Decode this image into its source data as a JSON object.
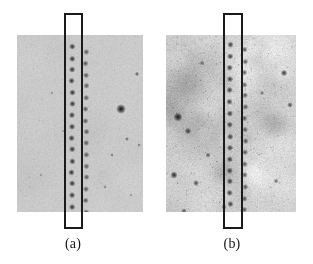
{
  "figure": {
    "background_color": "#ffffff",
    "width": 313,
    "height": 264,
    "kind": "two-panel grayscale radiograph comparison"
  },
  "panels": [
    {
      "id": "a",
      "caption": "(a)",
      "rect": {
        "x": 17,
        "y": 35,
        "w": 126,
        "h": 177
      },
      "base_gray": "#c9c9c9",
      "noise_amplitude": 11,
      "mottle_amplitude": 5,
      "mottle_count": 26,
      "description": "uniform light-gray radiograph with low background mottle",
      "dot_columns": [
        {
          "x": 55,
          "y_start": 12,
          "spacing": 11.4,
          "count": 16,
          "radius": 1.7,
          "darkness": 78,
          "jitter": 0.5
        },
        {
          "x": 69,
          "y_start": 17,
          "spacing": 11.4,
          "count": 15,
          "radius": 1.6,
          "darkness": 60,
          "jitter": 0.6
        }
      ],
      "specks": [
        {
          "x": 104,
          "y": 74,
          "r": 2.6,
          "d": 96
        },
        {
          "x": 120,
          "y": 39,
          "r": 1.2,
          "d": 58
        },
        {
          "x": 110,
          "y": 104,
          "r": 1.1,
          "d": 52
        },
        {
          "x": 95,
          "y": 120,
          "r": 1.0,
          "d": 46
        },
        {
          "x": 122,
          "y": 110,
          "r": 1.0,
          "d": 44
        },
        {
          "x": 35,
          "y": 58,
          "r": 0.9,
          "d": 36
        },
        {
          "x": 24,
          "y": 140,
          "r": 0.9,
          "d": 34
        },
        {
          "x": 88,
          "y": 152,
          "r": 1.0,
          "d": 40
        },
        {
          "x": 114,
          "y": 160,
          "r": 0.9,
          "d": 34
        },
        {
          "x": 46,
          "y": 96,
          "r": 0.8,
          "d": 30
        }
      ]
    },
    {
      "id": "b",
      "caption": "(b)",
      "rect": {
        "x": 166,
        "y": 35,
        "w": 130,
        "h": 177
      },
      "base_gray": "#cfcfcf",
      "noise_amplitude": 20,
      "mottle_amplitude": 16,
      "mottle_count": 90,
      "description": "noisier radiograph with dark mottled streaks concentrated on the left side",
      "dot_columns": [
        {
          "x": 64,
          "y_start": 10,
          "spacing": 11.4,
          "count": 17,
          "radius": 1.7,
          "darkness": 74,
          "jitter": 0.6
        },
        {
          "x": 79,
          "y_start": 15,
          "spacing": 11.4,
          "count": 16,
          "radius": 1.6,
          "darkness": 62,
          "jitter": 0.7
        }
      ],
      "specks": [
        {
          "x": 12,
          "y": 82,
          "r": 2.4,
          "d": 88
        },
        {
          "x": 22,
          "y": 96,
          "r": 1.8,
          "d": 70
        },
        {
          "x": 8,
          "y": 140,
          "r": 2.0,
          "d": 78
        },
        {
          "x": 30,
          "y": 148,
          "r": 1.6,
          "d": 66
        },
        {
          "x": 42,
          "y": 120,
          "r": 1.4,
          "d": 58
        },
        {
          "x": 118,
          "y": 38,
          "r": 1.8,
          "d": 76
        },
        {
          "x": 124,
          "y": 70,
          "r": 1.5,
          "d": 64
        },
        {
          "x": 110,
          "y": 146,
          "r": 1.3,
          "d": 54
        },
        {
          "x": 96,
          "y": 58,
          "r": 1.2,
          "d": 50
        },
        {
          "x": 58,
          "y": 172,
          "r": 1.4,
          "d": 56
        },
        {
          "x": 36,
          "y": 28,
          "r": 1.3,
          "d": 52
        },
        {
          "x": 18,
          "y": 176,
          "r": 1.5,
          "d": 60
        }
      ]
    }
  ],
  "roi_boxes": [
    {
      "id": "roi-a",
      "for_panel": "a",
      "x": 64,
      "y": 13,
      "w": 19,
      "h": 216,
      "stroke_color": "#1a1a1a",
      "stroke_width": 2
    },
    {
      "id": "roi-b",
      "for_panel": "b",
      "x": 223,
      "y": 13,
      "w": 20,
      "h": 216,
      "stroke_color": "#1a1a1a",
      "stroke_width": 2
    }
  ],
  "captions": {
    "a": "(a)",
    "b": "(b)"
  }
}
